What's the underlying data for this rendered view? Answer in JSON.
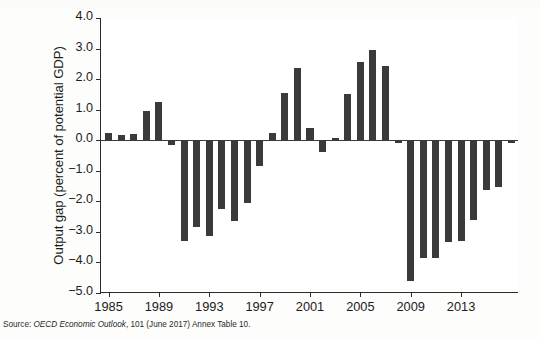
{
  "figure": {
    "source_prefix": "Source:",
    "source_italic": "OECD Economic Outlook",
    "source_rest": ", 101 (June 2017) Annex Table 10.",
    "colors": {
      "bar": "#3a3a3a",
      "axis": "#2b2b2b",
      "background": "#ffffff",
      "page": "#fdfdfb"
    }
  },
  "chart_data": {
    "type": "bar",
    "title": "",
    "xlabel": "",
    "ylabel": "Output gap (percent of potential GDP)",
    "ylim": [
      -5.0,
      4.0
    ],
    "yticks": [
      4.0,
      3.0,
      2.0,
      1.0,
      0.0,
      -1.0,
      -2.0,
      -3.0,
      -4.0,
      -5.0
    ],
    "ytick_labels": [
      "4.0",
      "3.0",
      "2.0",
      "1.0",
      "0.0",
      "−1.0",
      "−2.0",
      "−3.0",
      "−4.0",
      "−5.0"
    ],
    "xticks": [
      1985,
      1989,
      1993,
      1997,
      2001,
      2005,
      2009,
      2013
    ],
    "xtick_labels": [
      "1985",
      "1989",
      "1993",
      "1997",
      "2001",
      "2005",
      "2009",
      "2013"
    ],
    "xlim": [
      1984.4,
      2017.6
    ],
    "grid": false,
    "legend": null,
    "categories": [
      1985,
      1986,
      1987,
      1988,
      1989,
      1990,
      1991,
      1992,
      1993,
      1994,
      1995,
      1996,
      1997,
      1998,
      1999,
      2000,
      2001,
      2002,
      2003,
      2004,
      2005,
      2006,
      2007,
      2008,
      2009,
      2010,
      2011,
      2012,
      2013,
      2014,
      2015,
      2016,
      2017
    ],
    "values": [
      0.25,
      0.17,
      0.2,
      0.96,
      1.26,
      -0.15,
      -3.3,
      -2.85,
      -3.15,
      -2.25,
      -2.65,
      -2.05,
      -0.85,
      0.25,
      1.54,
      2.36,
      0.41,
      -0.38,
      0.06,
      1.52,
      2.57,
      2.95,
      2.43,
      -0.08,
      -4.62,
      -3.85,
      -3.87,
      -3.33,
      -3.3,
      -2.6,
      -1.62,
      -1.53,
      -0.1
    ],
    "value_unit": "percent of potential GDP"
  }
}
